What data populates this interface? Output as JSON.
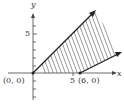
{
  "diagram": {
    "type": "shaded-region-graph",
    "axes": {
      "x_label": "x",
      "y_label": "y",
      "x_tick_label": "5",
      "y_tick_label": "5"
    },
    "points": [
      {
        "label": "(0, 0)",
        "x": 0,
        "y": 0
      },
      {
        "label": "(6, 0)",
        "x": 6,
        "y": 0
      }
    ],
    "rays": [
      {
        "from": [
          0,
          0
        ],
        "direction": "upper-right, slope 1"
      },
      {
        "from": [
          6,
          0
        ],
        "direction": "right, slope 1/2"
      }
    ],
    "shading": "hatched region between the two rays above the x-axis",
    "colors": {
      "lines": "#333333",
      "hatch": "#555555"
    }
  }
}
